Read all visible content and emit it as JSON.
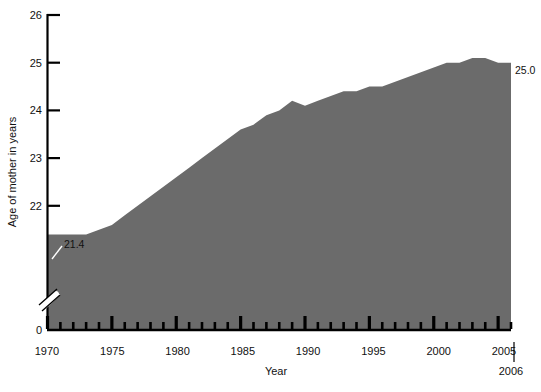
{
  "chart_data": {
    "type": "area",
    "title": "",
    "xlabel": "Year",
    "ylabel": "Age of mother in years",
    "x": [
      1970,
      1971,
      1972,
      1973,
      1974,
      1975,
      1976,
      1977,
      1978,
      1979,
      1980,
      1981,
      1982,
      1983,
      1984,
      1985,
      1986,
      1987,
      1988,
      1989,
      1990,
      1991,
      1992,
      1993,
      1994,
      1995,
      1996,
      1997,
      1998,
      1999,
      2000,
      2001,
      2002,
      2003,
      2004,
      2005,
      2006
    ],
    "values": [
      21.4,
      21.4,
      21.4,
      21.4,
      21.5,
      21.6,
      21.8,
      22.0,
      22.2,
      22.4,
      22.6,
      22.8,
      23.0,
      23.2,
      23.4,
      23.6,
      23.7,
      23.9,
      24.0,
      24.2,
      24.1,
      24.2,
      24.3,
      24.4,
      24.4,
      24.5,
      24.5,
      24.6,
      24.7,
      24.8,
      24.9,
      25.0,
      25.0,
      25.1,
      25.1,
      25.0,
      25.0
    ],
    "series": [
      {
        "name": "Age of mother in years",
        "values": [
          21.4,
          21.4,
          21.4,
          21.4,
          21.5,
          21.6,
          21.8,
          22.0,
          22.2,
          22.4,
          22.6,
          22.8,
          23.0,
          23.2,
          23.4,
          23.6,
          23.7,
          23.9,
          24.0,
          24.2,
          24.1,
          24.2,
          24.3,
          24.4,
          24.4,
          24.5,
          24.5,
          24.6,
          24.7,
          24.8,
          24.9,
          25.0,
          25.0,
          25.1,
          25.1,
          25.0,
          25.0
        ]
      }
    ],
    "xlim": [
      1970,
      2006
    ],
    "ylim": [
      0,
      26
    ],
    "y_axis_break": true,
    "y_axis_break_between": [
      0,
      22
    ],
    "y_tick_labels": [
      "26",
      "25",
      "24",
      "23",
      "22",
      "0"
    ],
    "y_tick_values": [
      26,
      25,
      24,
      23,
      22,
      0
    ],
    "x_tick_labels": [
      "1970",
      "1975",
      "1980",
      "1985",
      "1990",
      "1995",
      "2000",
      "2005"
    ],
    "x_tick_values": [
      1970,
      1975,
      1980,
      1985,
      1990,
      1995,
      2000,
      2005
    ],
    "x_minor_tick_interval": 1,
    "grid": false,
    "legend": null,
    "annotations": [
      {
        "text": "21.4",
        "x": 1970,
        "y": 21.4,
        "position": "left-start"
      },
      {
        "text": "25.0",
        "x": 2006,
        "y": 25.0,
        "position": "right-end"
      },
      {
        "text": "2006",
        "x": 2006,
        "y": 0,
        "position": "below-axis-right"
      }
    ],
    "colors": {
      "area_fill": "#6b6b6b",
      "axis": "#000000",
      "text": "#111111",
      "background": "#ffffff",
      "leader_line": "#ffffff"
    }
  }
}
